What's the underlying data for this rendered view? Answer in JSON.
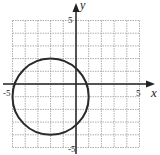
{
  "chart_data": {
    "type": "scatter",
    "subtype": "circle-on-coordinate-grid",
    "title": "",
    "xlabel": "x",
    "ylabel": "y",
    "xlim": [
      -5,
      5
    ],
    "ylim": [
      -5,
      5
    ],
    "grid": true,
    "grid_step": 1,
    "tick_labels": {
      "x_min": "-5",
      "x_max": "5",
      "y_min": "-5",
      "y_max": "5"
    },
    "circle": {
      "center": [
        -2,
        -1
      ],
      "radius": 3
    },
    "key_points": [
      {
        "x": -5,
        "y": -1
      },
      {
        "x": 1,
        "y": -1
      },
      {
        "x": -2,
        "y": 2
      },
      {
        "x": -2,
        "y": -4
      }
    ],
    "colors": {
      "curve": "#2a2a2a",
      "axes": "#222222",
      "grid": "#9a9a9a"
    }
  }
}
